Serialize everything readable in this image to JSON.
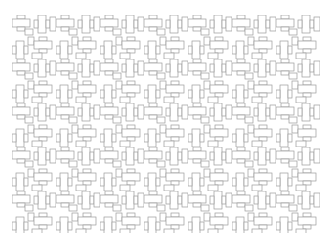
{
  "figure": {
    "stroke_color": "#9a9a9a",
    "fill_color": "#ffffff",
    "background": "#ffffff",
    "bounds": {
      "x": 12,
      "y": 15,
      "width": 308,
      "height": 218
    },
    "tile": {
      "width": 22,
      "height": 22
    }
  }
}
